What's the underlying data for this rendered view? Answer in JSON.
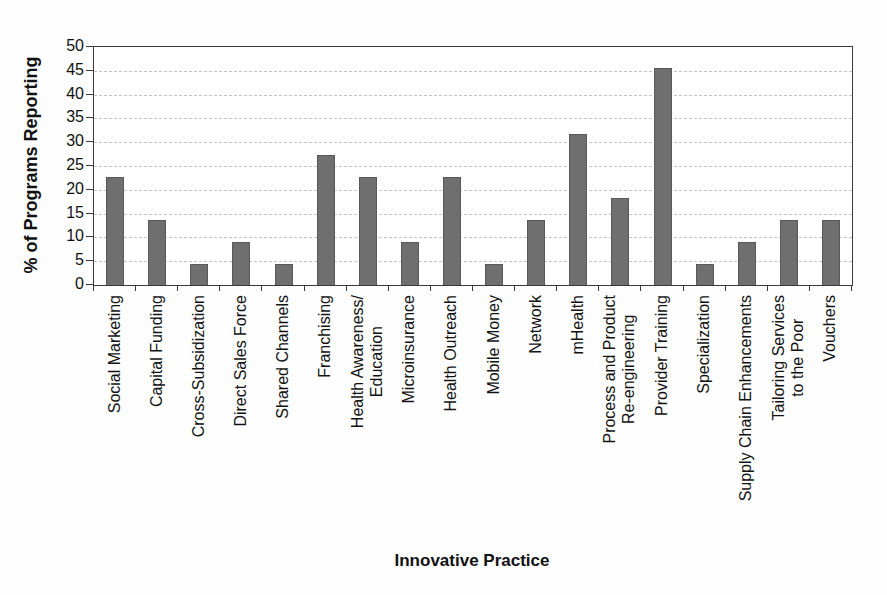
{
  "chart_data": {
    "type": "bar",
    "title": "",
    "xlabel": "Innovative Practice",
    "ylabel": "% of Programs Reporting",
    "ylim": [
      0,
      50
    ],
    "ytick_step": 5,
    "grid": true,
    "legend": "none",
    "bar_color": "#6f6f6f",
    "categories": [
      "Social Marketing",
      "Capital Funding",
      "Cross-Subsidization",
      "Direct Sales Force",
      "Shared Channels",
      "Franchising",
      "Health Awareness/\nEducation",
      "Microinsurance",
      "Health Outreach",
      "Mobile Money",
      "Network",
      "mHealth",
      "Process and Product\nRe-engineering",
      "Provider Training",
      "Specialization",
      "Supply Chain Enhancements",
      "Tailoring Services\nto the Poor",
      "Vouchers"
    ],
    "values": [
      22.7,
      13.6,
      4.5,
      9.1,
      4.5,
      27.3,
      22.7,
      9.1,
      22.7,
      4.5,
      13.6,
      31.8,
      18.2,
      45.5,
      4.5,
      9.1,
      13.6,
      13.6
    ]
  }
}
